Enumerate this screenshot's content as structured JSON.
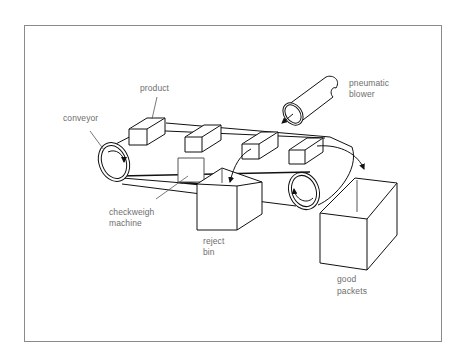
{
  "figure": {
    "type": "schematic diagram"
  },
  "labels": {
    "product": "product",
    "conveyor": "conveyor",
    "pneumatic_blower_line1": "pneumatic",
    "pneumatic_blower_line2": "blower",
    "checkweigh_line1": "checkweigh",
    "checkweigh_line2": "machine",
    "reject_bin_line1": "reject",
    "reject_bin_line2": "bin",
    "good_packets_line1": "good",
    "good_packets_line2": "packets"
  },
  "components": [
    {
      "id": "product",
      "count": 4
    },
    {
      "id": "conveyor",
      "rollers": 2
    },
    {
      "id": "pneumatic-blower"
    },
    {
      "id": "checkweigh-machine"
    },
    {
      "id": "reject-bin"
    },
    {
      "id": "good-packets-bin"
    }
  ],
  "colors": {
    "line": "#111111",
    "label": "#6e6e6e",
    "frame": "#8a8a8a",
    "background": "#ffffff"
  }
}
